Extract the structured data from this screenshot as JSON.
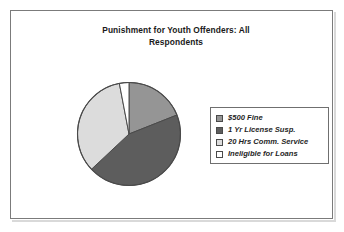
{
  "figure": {
    "title_line_1": "Punishment for Youth Offenders: All",
    "title_line_2": "Respondents"
  },
  "legend": {
    "items": [
      {
        "label": "$500 Fine",
        "color": "#959595",
        "swatch_name": "legend-swatch-500-fine"
      },
      {
        "label": "1 Yr License Susp.",
        "color": "#5d5d5d",
        "swatch_name": "legend-swatch-license-susp"
      },
      {
        "label": "20 Hrs Comm. Service",
        "color": "#dcdcdc",
        "swatch_name": "legend-swatch-comm-service"
      },
      {
        "label": "Ineligible for Loans",
        "color": "#ffffff",
        "swatch_name": "legend-swatch-ineligible-loans"
      }
    ]
  },
  "chart_data": {
    "type": "pie",
    "title": "Punishment for Youth Offenders: All Respondents",
    "xlabel": "",
    "ylabel": "",
    "grid": false,
    "legend_position": "right",
    "start_angle_deg": 0,
    "direction": "clockwise",
    "categories": [
      "$500 Fine",
      "1 Yr License Susp.",
      "20 Hrs Comm. Service",
      "Ineligible for Loans"
    ],
    "values": [
      19,
      44,
      34,
      3
    ],
    "value_unit": "percent",
    "colors": [
      "#959595",
      "#5d5d5d",
      "#dcdcdc",
      "#ffffff"
    ],
    "slice_angles_deg": [
      68.4,
      158.4,
      122.4,
      10.8
    ],
    "slice_boundaries_deg": [
      0,
      68.4,
      226.8,
      349.2,
      360
    ],
    "data_labels_shown": false
  }
}
